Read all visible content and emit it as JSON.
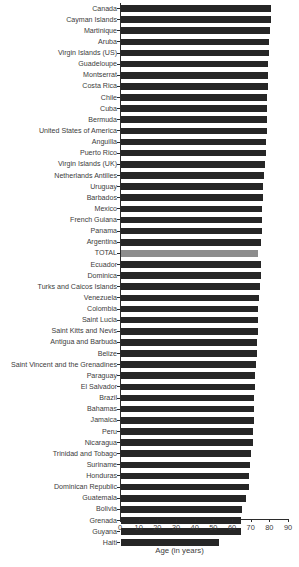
{
  "chart_data": {
    "type": "bar",
    "orientation": "horizontal",
    "title": "",
    "subtitle": "",
    "xlabel": "Age (in years)",
    "ylabel": "",
    "xlim": [
      0,
      90
    ],
    "xticks": [
      0,
      10,
      20,
      30,
      40,
      50,
      60,
      70,
      80,
      90
    ],
    "xtick_labels": [
      "0",
      "10",
      "20",
      "30",
      "40",
      "50",
      "60",
      "70",
      "80",
      "90"
    ],
    "grid": false,
    "legend": null,
    "bar_color": "#262626",
    "highlight_color": "#8d8d8d",
    "highlight_category": "TOTAL",
    "categories": [
      "Canada",
      "Cayman Islands",
      "Martinique",
      "Aruba",
      "Virgin Islands (US)",
      "Guadeloupe",
      "Montserrat",
      "Costa Rica",
      "Chile",
      "Cuba",
      "Bermuda",
      "United States of America",
      "Anguilla",
      "Puerto Rico",
      "Virgin Islands (UK)",
      "Netherlands Antilles",
      "Uruguay",
      "Barbados",
      "Mexico",
      "French Guiana",
      "Panama",
      "Argentina",
      "TOTAL",
      "Ecuador",
      "Dominica",
      "Turks and Caicos Islands",
      "Venezuela",
      "Colombia",
      "Saint Lucia",
      "Saint Kitts and Nevis",
      "Antigua and Barbuda",
      "Belize",
      "Saint Vincent and the Grenadines",
      "Paraguay",
      "El Salvador",
      "Brazil",
      "Bahamas",
      "Jamaica",
      "Peru",
      "Nicaragua",
      "Trinidad and Tobago",
      "Suriname",
      "Honduras",
      "Dominican Republic",
      "Guatemala",
      "Bolivia",
      "Grenada",
      "Guyana",
      "Haiti"
    ],
    "values": [
      80.3,
      80.1,
      79.6,
      79.3,
      79.1,
      79.0,
      78.7,
      78.5,
      78.4,
      78.2,
      78.1,
      78.0,
      77.8,
      77.6,
      77.3,
      76.8,
      76.2,
      76.0,
      75.8,
      75.5,
      75.3,
      75.1,
      73.5,
      74.9,
      74.8,
      74.6,
      74.0,
      73.6,
      73.4,
      73.2,
      73.0,
      72.7,
      72.4,
      72.0,
      71.8,
      71.5,
      71.3,
      71.0,
      70.8,
      70.5,
      69.6,
      69.2,
      68.8,
      68.4,
      67.2,
      64.9,
      64.5,
      64.3,
      52.5
    ]
  },
  "axis": {
    "x_title": "Age (in years)"
  }
}
